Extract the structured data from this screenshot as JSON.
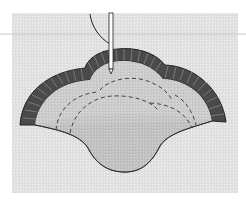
{
  "figure": {
    "caption_fragment": "",
    "colors": {
      "page_background": "#ffffff",
      "fabric_background": "#e6e6e6",
      "appliqué_fill": "#c9c9c9",
      "inner_fabric": "#d2d2d2",
      "satin_stitch_dark": "#3a3a3a",
      "satin_stitch_light": "#8a8a8a",
      "outline": "#2a2a2a",
      "dashed_guide": "#444444",
      "needle": "#ffffff"
    },
    "elements": {
      "needle_icon": "needle-icon",
      "thread_icon": "thread-icon"
    }
  }
}
